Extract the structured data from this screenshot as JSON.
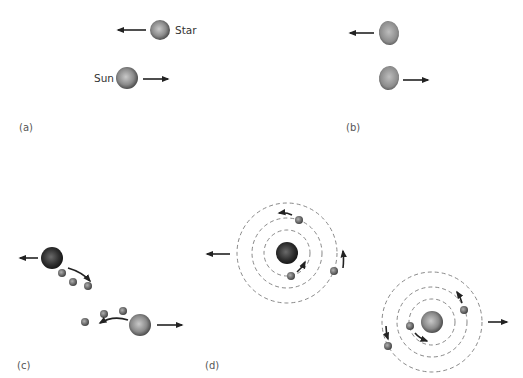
{
  "figure": {
    "panels": {
      "a": {
        "label": "(a)",
        "bodies": [
          {
            "name": "Star",
            "motion": "left"
          },
          {
            "name": "Sun",
            "motion": "right"
          }
        ]
      },
      "b": {
        "label": "(b)",
        "bodies": [
          {
            "description": "tidally distorted star",
            "motion": "left"
          },
          {
            "description": "tidally distorted sun",
            "motion": "right"
          }
        ]
      },
      "c": {
        "label": "(c)",
        "description": "material pulled out of both stars by tidal interaction",
        "streams": [
          {
            "star_motion": "left",
            "blob_count": 3
          },
          {
            "star_motion": "right",
            "blob_count": 3
          }
        ]
      },
      "d": {
        "label": "(d)",
        "description": "two stars each left with orbiting planets",
        "systems": [
          {
            "motion": "left",
            "orbit_count": 3,
            "planet_count": 3
          },
          {
            "motion": "right",
            "orbit_count": 3,
            "planet_count": 3
          }
        ]
      }
    },
    "colors": {
      "ink": "#222222",
      "orbit": "#7a7a7a",
      "sphere_light": "#c8c8c8",
      "sphere_dark": "#3a3a3a"
    }
  }
}
